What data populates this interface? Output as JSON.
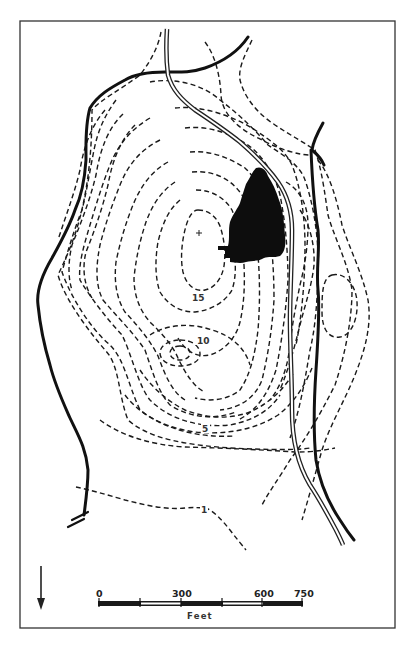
{
  "map": {
    "type": "topographic contour map",
    "contour_labels": [
      {
        "value": "15",
        "x": 194,
        "y": 300
      },
      {
        "value": "10",
        "x": 197,
        "y": 343
      },
      {
        "value": "5",
        "x": 203,
        "y": 431
      },
      {
        "value": "1",
        "x": 201,
        "y": 512
      }
    ],
    "summit_marker": "+",
    "features": [
      "contour-lines",
      "road",
      "boundary-lines",
      "building-footprint",
      "depression-contour"
    ],
    "colors": {
      "ink": "#111111",
      "paper": "#ffffff",
      "frame": "#333333"
    }
  },
  "north_arrow": {
    "icon": "arrow-down",
    "direction": "down"
  },
  "scale_bar": {
    "ticks": [
      "0",
      "300",
      "600",
      "750"
    ],
    "unit": "Feet",
    "max_value": 750
  }
}
